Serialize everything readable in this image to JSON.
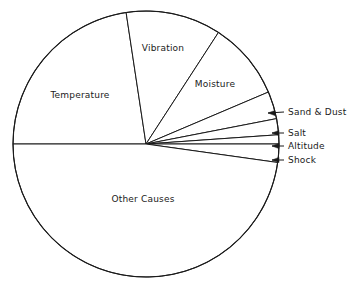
{
  "chart_data": {
    "type": "pie",
    "title": "",
    "subtitle": "",
    "xlabel": "",
    "ylabel": "",
    "legend_position": "none",
    "grid": false,
    "categories": [
      "Temperature",
      "Vibration",
      "Moisture",
      "Sand & Dust",
      "Salt",
      "Altitude",
      "Shock",
      "Other Causes"
    ],
    "values": [
      22.6,
      11.5,
      9.4,
      3.3,
      2.0,
      1.1,
      2.2,
      47.9
    ],
    "unit": "percent",
    "slices": [
      {
        "label": "Temperature",
        "value": 22.6,
        "start_angle_deg": 98.6,
        "end_angle_deg": 180.0,
        "label_x": 80,
        "label_y": 95,
        "label_anchor": "center",
        "callout": false
      },
      {
        "label": "Vibration",
        "value": 11.5,
        "start_angle_deg": 57.0,
        "end_angle_deg": 98.6,
        "label_x": 163,
        "label_y": 48,
        "label_anchor": "center",
        "callout": false
      },
      {
        "label": "Moisture",
        "value": 9.4,
        "start_angle_deg": 23.0,
        "end_angle_deg": 57.0,
        "label_x": 215,
        "label_y": 84,
        "label_anchor": "center",
        "callout": false
      },
      {
        "label": "Sand & Dust",
        "value": 3.3,
        "start_angle_deg": 11.0,
        "end_angle_deg": 23.0,
        "label_x": 288,
        "label_y": 112,
        "label_anchor": "left",
        "callout": true,
        "arrow_tip_x": 268,
        "arrow_tip_y": 113,
        "leader_x": 284,
        "leader_y": 112
      },
      {
        "label": "Salt",
        "value": 2.0,
        "start_angle_deg": 4.0,
        "end_angle_deg": 11.0,
        "label_x": 288,
        "label_y": 133,
        "label_anchor": "left",
        "callout": true,
        "arrow_tip_x": 272,
        "arrow_tip_y": 133,
        "leader_x": 284,
        "leader_y": 133
      },
      {
        "label": "Altitude",
        "value": 1.1,
        "start_angle_deg": 0.0,
        "end_angle_deg": 4.0,
        "label_x": 288,
        "label_y": 146,
        "label_anchor": "left",
        "callout": true,
        "arrow_tip_x": 272,
        "arrow_tip_y": 146,
        "leader_x": 284,
        "leader_y": 146
      },
      {
        "label": "Shock",
        "value": 2.2,
        "start_angle_deg": -8.0,
        "end_angle_deg": 0.0,
        "label_x": 288,
        "label_y": 160,
        "label_anchor": "left",
        "callout": true,
        "arrow_tip_x": 272,
        "arrow_tip_y": 160,
        "leader_x": 284,
        "leader_y": 160
      },
      {
        "label": "Other Causes",
        "value": 47.9,
        "start_angle_deg": 180.0,
        "end_angle_deg": 352.0,
        "label_x": 143,
        "label_y": 199,
        "label_anchor": "center",
        "callout": false
      }
    ],
    "geometry": {
      "center_x": 146,
      "center_y": 144,
      "radius": 133
    },
    "colors": {
      "slice_fill": "#ffffff",
      "stroke": "#1a1a1a",
      "background": "#ffffff",
      "text": "#1a1a1a"
    }
  }
}
